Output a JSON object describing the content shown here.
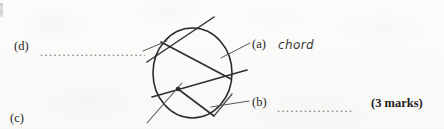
{
  "page": {
    "background_color": "#fbfbfa",
    "ink_color": "#2f2f2f",
    "width": 444,
    "height": 129
  },
  "edge_artifact": {
    "name": "scan-edge-mark",
    "note": "partial cut-off glyph at left margin"
  },
  "labels": {
    "d": {
      "enumerator": "(d)",
      "answer_text": "",
      "dots": "...................................."
    },
    "c": {
      "enumerator": "(c)"
    },
    "a": {
      "enumerator": "(a)",
      "answer_text": "chord"
    },
    "b": {
      "enumerator": "(b)",
      "answer_text": "",
      "dots": "........................"
    }
  },
  "marks": {
    "text": "(3 marks)"
  },
  "diagram": {
    "name": "circle-parts-diagram",
    "circle": {
      "cx": 192.5,
      "cy": 73,
      "rx": 39.5,
      "ry": 45
    },
    "center_dot": {
      "cx": 178,
      "cy": 89,
      "r": 2.2
    },
    "lines": [
      {
        "name": "tangent-line",
        "x1": 147,
        "y1": 62,
        "x2": 214,
        "y2": 17
      },
      {
        "name": "chord-upper",
        "x1": 162,
        "y1": 41,
        "x2": 231,
        "y2": 79
      },
      {
        "name": "secant-line",
        "x1": 152,
        "y1": 97,
        "x2": 247,
        "y2": 70
      },
      {
        "name": "radius-lower-right",
        "x1": 178,
        "y1": 89,
        "x2": 214,
        "y2": 115
      },
      {
        "name": "sector-arc-line",
        "x1": 214,
        "y1": 115,
        "x2": 232,
        "y2": 95
      },
      {
        "name": "radius-lower-left",
        "x1": 181,
        "y1": 84,
        "x2": 148,
        "y2": 122
      },
      {
        "name": "leader-a",
        "x1": 222,
        "y1": 57,
        "x2": 249,
        "y2": 43
      },
      {
        "name": "leader-b",
        "x1": 212,
        "y1": 107,
        "x2": 248,
        "y2": 101
      },
      {
        "name": "leader-d",
        "x1": 144,
        "y1": 50,
        "x2": 168,
        "y2": 41
      }
    ]
  }
}
